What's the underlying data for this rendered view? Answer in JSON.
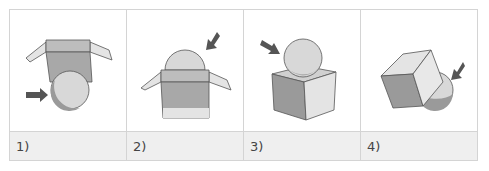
{
  "figure": {
    "panels": [
      {
        "label": "1)",
        "description": "open box above sphere, arrow pointing to sphere below box"
      },
      {
        "label": "2)",
        "description": "sphere inside open box, arrow pointing to sphere top"
      },
      {
        "label": "3)",
        "description": "sphere on top of cube, arrow pointing to sphere"
      },
      {
        "label": "4)",
        "description": "tilted cube with sphere beneath, arrow pointing to sphere"
      }
    ],
    "colors": {
      "grid_line": "#d4d4d4",
      "label_bg": "#efefef",
      "arrow": "#555555",
      "shape_dark": "#9a9a9a",
      "shape_mid": "#bdbdbd",
      "shape_light": "#e4e4e4",
      "outline": "#555555"
    }
  }
}
